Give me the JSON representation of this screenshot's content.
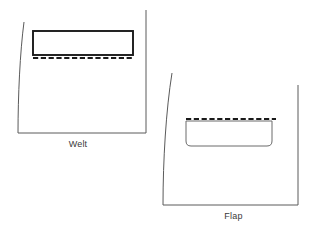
{
  "figure": {
    "background_color": "#ffffff",
    "line_color": "#5a5a5a",
    "stitch_color": "#1a1a1a",
    "text_color": "#3a3a3a"
  },
  "diagrams": [
    {
      "id": "welt",
      "caption": "Welt",
      "panel": {
        "name": "garment-panel-welt",
        "path": "M 24 22 C 20 52, 18 96, 18 133 L 146 133 L 146 10",
        "description": "garment panel outline with curved left side edge, straight bottom and right edges, open top"
      },
      "pocket": {
        "name": "welt-pocket-opening",
        "type": "rectangle",
        "x": 33,
        "y": 31,
        "width": 100,
        "height": 24,
        "stroke": "#1a1a1a",
        "stroke_width": 1.9,
        "corner_radius": 0
      },
      "stitch_line": {
        "name": "welt-stitch-line",
        "type": "dashed",
        "x1": 33,
        "y1": 58,
        "x2": 133,
        "y2": 58,
        "dash": "5.2 2.6"
      }
    },
    {
      "id": "flap",
      "caption": "Flap",
      "panel": {
        "name": "garment-panel-flap",
        "path": "M 172 73 C 166 110, 163 160, 163 205 L 298 205 L 298 85",
        "description": "garment panel outline with curved left side edge, straight bottom and right edges, open top"
      },
      "pocket": {
        "name": "flap-pocket-shape",
        "type": "rounded-rectangle",
        "x": 186,
        "y": 121,
        "width": 86,
        "height": 25,
        "stroke": "#6a6a6a",
        "stroke_width": 1,
        "corner_radius_bottom": 5
      },
      "stitch_line": {
        "name": "flap-stitch-line",
        "type": "dashed",
        "x1": 186,
        "y1": 119,
        "x2": 276,
        "y2": 119,
        "dash": "5.2 2.6"
      }
    }
  ]
}
